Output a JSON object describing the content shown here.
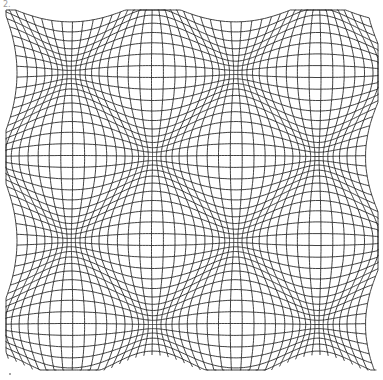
{
  "figure": {
    "label": "2."
  },
  "grid": {
    "x_min": 8,
    "x_max": 376,
    "y_min": 12,
    "y_max": 368,
    "spacing": 8,
    "stroke_color": "#2b2b2b",
    "stroke_width": 0.9,
    "warp": {
      "amplitude_x": 13,
      "amplitude_y": 13,
      "period_x": 165,
      "period_y": 168,
      "bulge_origin_x": 153,
      "bulge_origin_y": 73
    }
  },
  "colors": {
    "background": "#ffffff",
    "label": "#9a9a9a"
  }
}
